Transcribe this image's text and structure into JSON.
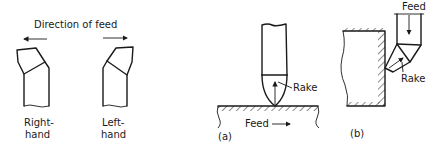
{
  "figure": {
    "left_panel": {
      "title": "Direction of feed",
      "tools": [
        {
          "label_line1": "Right-",
          "label_line2": "hand",
          "feed_arrow": "left"
        },
        {
          "label_line1": "Left-",
          "label_line2": "hand",
          "feed_arrow": "right"
        }
      ]
    },
    "panel_a": {
      "caption": "(a)",
      "rake_label": "Rake",
      "feed_label": "Feed"
    },
    "panel_b": {
      "caption": "(b)",
      "rake_label": "Rake",
      "feed_label": "Feed"
    }
  }
}
